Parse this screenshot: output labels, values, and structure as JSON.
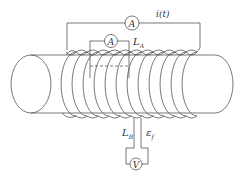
{
  "diagram": {
    "labels": {
      "current": "i(t)",
      "loop_a": "L",
      "loop_a_sub": "A",
      "loop_b": "L",
      "loop_b_sub": "B",
      "emf": "ε",
      "emf_sub": "f"
    },
    "meters": {
      "outer_ammeter": "A",
      "inner_ammeter": "A",
      "voltmeter": "V"
    },
    "colors": {
      "line": "#555555",
      "background": "#ffffff"
    }
  }
}
